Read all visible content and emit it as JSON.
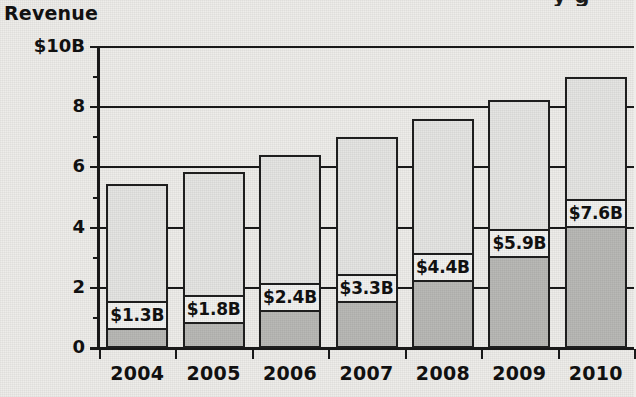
{
  "chart_data": {
    "type": "bar",
    "title": "",
    "title_cut_off": "y g",
    "ylabel": "Revenue",
    "xlabel": "",
    "stacked": true,
    "grid": true,
    "legend": "none",
    "ylim": [
      0,
      10
    ],
    "yticks": [
      0,
      2,
      4,
      6,
      8,
      10
    ],
    "ytick_labels": [
      "0",
      "2",
      "4",
      "6",
      "8",
      "$10B"
    ],
    "categories": [
      "2004",
      "2005",
      "2006",
      "2007",
      "2008",
      "2009",
      "2010"
    ],
    "series": [
      {
        "name": "labeled-segment",
        "style": "dark-gray",
        "values": [
          0.7,
          0.9,
          1.3,
          1.6,
          2.3,
          3.1,
          4.1
        ],
        "data_labels": [
          "$1.3B",
          "$1.8B",
          "$2.4B",
          "$3.3B",
          "$4.4B",
          "$5.9B",
          "$7.6B"
        ]
      },
      {
        "name": "upper-segment",
        "style": "light-gray",
        "values": [
          4.75,
          4.95,
          5.1,
          5.4,
          5.3,
          5.15,
          4.9
        ]
      }
    ],
    "totals": [
      5.45,
      5.85,
      6.4,
      7.0,
      7.6,
      8.25,
      9.0
    ],
    "colors": {
      "dark_segment": "#b9b9b6",
      "light_segment": "#e5e5e3",
      "label_box": "#f2f2f0",
      "outline": "#1f1f1f",
      "background": "#eeedea",
      "text": "#111111"
    }
  }
}
